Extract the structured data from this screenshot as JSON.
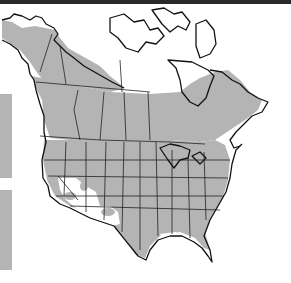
{
  "map": {
    "type": "species-range-map",
    "region": "North America",
    "colors": {
      "range_fill": "#b4b4b4",
      "land_fill": "#ffffff",
      "outline": "#111111",
      "frame": "#2a2a2a"
    },
    "legend_boxes": [
      {
        "color": "#b4b4b4"
      },
      {
        "color": "#b4b4b4"
      }
    ]
  }
}
